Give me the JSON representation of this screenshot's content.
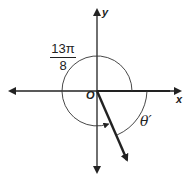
{
  "diagram": {
    "type": "unit-angle-reference-diagram",
    "axes": {
      "x_label": "x",
      "y_label": "y",
      "origin_label": "O"
    },
    "angle_label": {
      "numerator": "13π",
      "denominator": "8"
    },
    "reference_angle_label": "θ′",
    "colors": {
      "stroke": "#222222",
      "background": "#ffffff"
    }
  }
}
